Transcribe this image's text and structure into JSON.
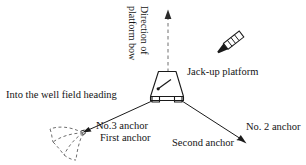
{
  "figure": {
    "type": "diagram",
    "background": "#ffffff",
    "line_color": "#1a1a1a",
    "dashed_color": "#6b6b6b"
  },
  "labels": {
    "direction_line1": "Direction of",
    "direction_line2": "platform bow",
    "platform": "Jack-up platform",
    "heading": "Into the well field heading",
    "anchor3": "No.3 anchor",
    "first_anchor": "First anchor",
    "second_anchor": "Second anchor",
    "anchor2": "No. 2 anchor"
  },
  "elements": {
    "bow_arrow": "dashed-up-arrow",
    "platform_icon": "jack-up-platform-trapezoid",
    "vessel_icon": "anchor-handling-tug",
    "mooring_line_left": "mooring-line-to-anchor-3",
    "mooring_line_right": "mooring-line-to-anchor-2",
    "anchor_fan": "dashed-anchor-drag-fan"
  }
}
